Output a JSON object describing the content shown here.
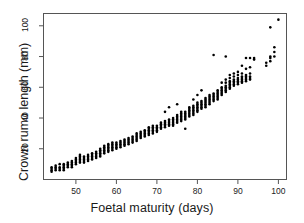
{
  "chart_data": {
    "type": "scatter",
    "title": "",
    "xlabel": "Foetal maturity (days)",
    "ylabel": "Crown rumo length (mm)",
    "xlim": [
      42,
      102
    ],
    "ylim": [
      0,
      108
    ],
    "xticks": [
      50,
      60,
      70,
      80,
      90,
      100
    ],
    "yticks": [
      20,
      40,
      60,
      80,
      100
    ],
    "xtick_labels": [
      "50",
      "60",
      "70",
      "80",
      "90",
      "100"
    ],
    "ytick_labels": [
      "20",
      "40",
      "60",
      "80",
      "100"
    ],
    "grid": false,
    "legend": false,
    "marker": "filled-circle",
    "marker_color": "#000000",
    "marker_size_px": 2.6,
    "frame": true,
    "points": [
      [
        44,
        6
      ],
      [
        44,
        7
      ],
      [
        44,
        8
      ],
      [
        44,
        5
      ],
      [
        45,
        6
      ],
      [
        45,
        8
      ],
      [
        45,
        9
      ],
      [
        45,
        7
      ],
      [
        46,
        7
      ],
      [
        46,
        8
      ],
      [
        46,
        6
      ],
      [
        46,
        10
      ],
      [
        47,
        8
      ],
      [
        47,
        9
      ],
      [
        47,
        7
      ],
      [
        47,
        10
      ],
      [
        47,
        6
      ],
      [
        48,
        9
      ],
      [
        48,
        10
      ],
      [
        48,
        8
      ],
      [
        48,
        11
      ],
      [
        49,
        10
      ],
      [
        49,
        11
      ],
      [
        49,
        9
      ],
      [
        49,
        12
      ],
      [
        49,
        8
      ],
      [
        50,
        12
      ],
      [
        50,
        11
      ],
      [
        50,
        13
      ],
      [
        50,
        10
      ],
      [
        50,
        14
      ],
      [
        51,
        13
      ],
      [
        51,
        12
      ],
      [
        51,
        14
      ],
      [
        51,
        15
      ],
      [
        51,
        11
      ],
      [
        51,
        16
      ],
      [
        52,
        13
      ],
      [
        52,
        14
      ],
      [
        52,
        12
      ],
      [
        52,
        15
      ],
      [
        52,
        11
      ],
      [
        53,
        14
      ],
      [
        53,
        15
      ],
      [
        53,
        13
      ],
      [
        53,
        16
      ],
      [
        53,
        12
      ],
      [
        54,
        15
      ],
      [
        54,
        16
      ],
      [
        54,
        14
      ],
      [
        54,
        17
      ],
      [
        54,
        13
      ],
      [
        55,
        16
      ],
      [
        55,
        17
      ],
      [
        55,
        15
      ],
      [
        55,
        18
      ],
      [
        55,
        14
      ],
      [
        56,
        17
      ],
      [
        56,
        18
      ],
      [
        56,
        19
      ],
      [
        56,
        16
      ],
      [
        56,
        20
      ],
      [
        56,
        15
      ],
      [
        57,
        19
      ],
      [
        57,
        20
      ],
      [
        57,
        18
      ],
      [
        57,
        21
      ],
      [
        57,
        17
      ],
      [
        57,
        22
      ],
      [
        58,
        20
      ],
      [
        58,
        21
      ],
      [
        58,
        22
      ],
      [
        58,
        19
      ],
      [
        58,
        23
      ],
      [
        58,
        18
      ],
      [
        59,
        21
      ],
      [
        59,
        22
      ],
      [
        59,
        20
      ],
      [
        59,
        23
      ],
      [
        59,
        19
      ],
      [
        59,
        24
      ],
      [
        60,
        21
      ],
      [
        60,
        22
      ],
      [
        60,
        23
      ],
      [
        60,
        20
      ],
      [
        60,
        24
      ],
      [
        61,
        22
      ],
      [
        61,
        23
      ],
      [
        61,
        24
      ],
      [
        61,
        21
      ],
      [
        61,
        25
      ],
      [
        62,
        23
      ],
      [
        62,
        24
      ],
      [
        62,
        25
      ],
      [
        62,
        22
      ],
      [
        62,
        26
      ],
      [
        63,
        25
      ],
      [
        63,
        26
      ],
      [
        63,
        24
      ],
      [
        63,
        27
      ],
      [
        63,
        23
      ],
      [
        64,
        26
      ],
      [
        64,
        27
      ],
      [
        64,
        25
      ],
      [
        64,
        28
      ],
      [
        64,
        24
      ],
      [
        65,
        27
      ],
      [
        65,
        28
      ],
      [
        65,
        29
      ],
      [
        65,
        26
      ],
      [
        65,
        30
      ],
      [
        65,
        25
      ],
      [
        66,
        28
      ],
      [
        66,
        29
      ],
      [
        66,
        30
      ],
      [
        66,
        27
      ],
      [
        66,
        31
      ],
      [
        67,
        30
      ],
      [
        67,
        31
      ],
      [
        67,
        29
      ],
      [
        67,
        32
      ],
      [
        67,
        28
      ],
      [
        68,
        31
      ],
      [
        68,
        32
      ],
      [
        68,
        33
      ],
      [
        68,
        30
      ],
      [
        68,
        34
      ],
      [
        68,
        29
      ],
      [
        69,
        32
      ],
      [
        69,
        33
      ],
      [
        69,
        34
      ],
      [
        69,
        31
      ],
      [
        69,
        35
      ],
      [
        69,
        30
      ],
      [
        70,
        33
      ],
      [
        70,
        34
      ],
      [
        70,
        32
      ],
      [
        70,
        35
      ],
      [
        70,
        31
      ],
      [
        71,
        34
      ],
      [
        71,
        35
      ],
      [
        71,
        36
      ],
      [
        71,
        33
      ],
      [
        71,
        37
      ],
      [
        72,
        35
      ],
      [
        72,
        36
      ],
      [
        72,
        37
      ],
      [
        72,
        34
      ],
      [
        72,
        38
      ],
      [
        72,
        44
      ],
      [
        73,
        36
      ],
      [
        73,
        37
      ],
      [
        73,
        38
      ],
      [
        73,
        35
      ],
      [
        73,
        39
      ],
      [
        73,
        47
      ],
      [
        74,
        37
      ],
      [
        74,
        38
      ],
      [
        74,
        39
      ],
      [
        74,
        36
      ],
      [
        74,
        40
      ],
      [
        74,
        35
      ],
      [
        75,
        38
      ],
      [
        75,
        39
      ],
      [
        75,
        40
      ],
      [
        75,
        41
      ],
      [
        75,
        37
      ],
      [
        75,
        42
      ],
      [
        75,
        49
      ],
      [
        76,
        39
      ],
      [
        76,
        40
      ],
      [
        76,
        41
      ],
      [
        76,
        42
      ],
      [
        76,
        38
      ],
      [
        76,
        43
      ],
      [
        76,
        44
      ],
      [
        77,
        40
      ],
      [
        77,
        41
      ],
      [
        77,
        42
      ],
      [
        77,
        43
      ],
      [
        77,
        39
      ],
      [
        77,
        44
      ],
      [
        77,
        33
      ],
      [
        78,
        42
      ],
      [
        78,
        43
      ],
      [
        78,
        44
      ],
      [
        78,
        45
      ],
      [
        78,
        41
      ],
      [
        78,
        46
      ],
      [
        78,
        47
      ],
      [
        79,
        43
      ],
      [
        79,
        44
      ],
      [
        79,
        45
      ],
      [
        79,
        46
      ],
      [
        79,
        47
      ],
      [
        79,
        42
      ],
      [
        79,
        48
      ],
      [
        79,
        52
      ],
      [
        80,
        45
      ],
      [
        80,
        46
      ],
      [
        80,
        47
      ],
      [
        80,
        48
      ],
      [
        80,
        44
      ],
      [
        80,
        49
      ],
      [
        80,
        50
      ],
      [
        80,
        55
      ],
      [
        81,
        47
      ],
      [
        81,
        48
      ],
      [
        81,
        49
      ],
      [
        81,
        50
      ],
      [
        81,
        46
      ],
      [
        81,
        51
      ],
      [
        81,
        58
      ],
      [
        82,
        49
      ],
      [
        82,
        50
      ],
      [
        82,
        51
      ],
      [
        82,
        48
      ],
      [
        82,
        52
      ],
      [
        82,
        53
      ],
      [
        82,
        47
      ],
      [
        83,
        50
      ],
      [
        83,
        51
      ],
      [
        83,
        52
      ],
      [
        83,
        53
      ],
      [
        83,
        49
      ],
      [
        83,
        54
      ],
      [
        83,
        55
      ],
      [
        84,
        52
      ],
      [
        84,
        53
      ],
      [
        84,
        54
      ],
      [
        84,
        51
      ],
      [
        84,
        55
      ],
      [
        84,
        56
      ],
      [
        84,
        81
      ],
      [
        85,
        54
      ],
      [
        85,
        55
      ],
      [
        85,
        56
      ],
      [
        85,
        53
      ],
      [
        85,
        57
      ],
      [
        85,
        58
      ],
      [
        85,
        52
      ],
      [
        86,
        56
      ],
      [
        86,
        57
      ],
      [
        86,
        58
      ],
      [
        86,
        55
      ],
      [
        86,
        59
      ],
      [
        86,
        60
      ],
      [
        86,
        63
      ],
      [
        87,
        58
      ],
      [
        87,
        59
      ],
      [
        87,
        60
      ],
      [
        87,
        57
      ],
      [
        87,
        61
      ],
      [
        87,
        63
      ],
      [
        87,
        65
      ],
      [
        87,
        80
      ],
      [
        88,
        60
      ],
      [
        88,
        61
      ],
      [
        88,
        62
      ],
      [
        88,
        63
      ],
      [
        88,
        59
      ],
      [
        88,
        64
      ],
      [
        88,
        66
      ],
      [
        88,
        68
      ],
      [
        89,
        62
      ],
      [
        89,
        63
      ],
      [
        89,
        64
      ],
      [
        89,
        61
      ],
      [
        89,
        65
      ],
      [
        89,
        67
      ],
      [
        89,
        69
      ],
      [
        90,
        63
      ],
      [
        90,
        64
      ],
      [
        90,
        65
      ],
      [
        90,
        62
      ],
      [
        90,
        66
      ],
      [
        90,
        68
      ],
      [
        90,
        70
      ],
      [
        91,
        64
      ],
      [
        91,
        65
      ],
      [
        91,
        66
      ],
      [
        91,
        63
      ],
      [
        91,
        67
      ],
      [
        91,
        69
      ],
      [
        91,
        74
      ],
      [
        92,
        65
      ],
      [
        92,
        66
      ],
      [
        92,
        67
      ],
      [
        92,
        64
      ],
      [
        92,
        68
      ],
      [
        92,
        72
      ],
      [
        92,
        79
      ],
      [
        93,
        66
      ],
      [
        93,
        67
      ],
      [
        93,
        65
      ],
      [
        93,
        69
      ],
      [
        93,
        73
      ],
      [
        93,
        79
      ],
      [
        94,
        79
      ],
      [
        94,
        78
      ],
      [
        97,
        74
      ],
      [
        97,
        76
      ],
      [
        98,
        77
      ],
      [
        98,
        79
      ],
      [
        98,
        80
      ],
      [
        98,
        99
      ],
      [
        99,
        80
      ],
      [
        99,
        83
      ],
      [
        99,
        86
      ],
      [
        100,
        104
      ]
    ]
  }
}
